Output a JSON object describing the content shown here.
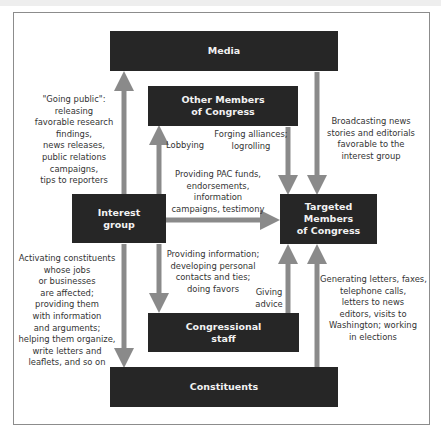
{
  "nodes": {
    "media": "Media",
    "other_members_l1": "Other Members",
    "other_members_l2": "of Congress",
    "interest_group_l1": "Interest",
    "interest_group_l2": "group",
    "targeted_l1": "Targeted Members",
    "targeted_l2": "of Congress",
    "staff_l1": "Congressional",
    "staff_l2": "staff",
    "constituents": "Constituents"
  },
  "edges": {
    "going_public": [
      "\"Going public\":",
      "releasing",
      "favorable research",
      "findings,",
      "news releases,",
      "public relations",
      "campaigns,",
      "tips to reporters"
    ],
    "lobbying": [
      "Lobbying"
    ],
    "forging": [
      "Forging alliances;",
      "logrolling"
    ],
    "broadcasting": [
      "Broadcasting news",
      "stories and editorials",
      "favorable to the",
      "interest group"
    ],
    "pac": [
      "Providing PAC funds,",
      "endorsements,",
      "information",
      "campaigns, testimony"
    ],
    "providing_info": [
      "Providing information;",
      "developing personal",
      "contacts and ties;",
      "doing favors"
    ],
    "giving_advice": [
      "Giving",
      "advice"
    ],
    "activating": [
      "Activating constituents",
      "whose jobs",
      "or businesses",
      "are affected;",
      "providing them",
      "with information",
      "and arguments;",
      "helping them organize,",
      "write letters and",
      "leaflets, and so on"
    ],
    "generating": [
      "Generating letters, faxes,",
      "telephone calls,",
      "letters to news",
      "editors, visits to",
      "Washington; working",
      "in elections"
    ]
  },
  "colors": {
    "box_fill": "#262626",
    "box_text": "#f2f2f2",
    "arrow": "#8a8a8a",
    "label_text": "#333333"
  }
}
